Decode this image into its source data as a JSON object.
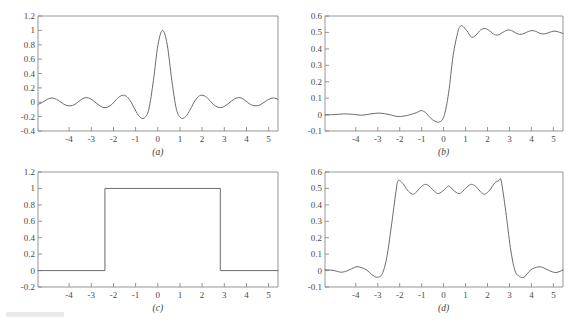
{
  "figure": {
    "background_color": "#ffffff",
    "axis_color": "#8a8a8a",
    "curve_color": "#6b6b6b",
    "label_color": "#4a4a4a",
    "layout": "2x2 grid of plots"
  },
  "chart_data": [
    {
      "id": "a",
      "type": "line",
      "caption": "(a)",
      "title": "",
      "xlabel": "",
      "ylabel": "",
      "xlim": [
        -5.4,
        5.0
      ],
      "ylim": [
        -0.4,
        1.2
      ],
      "grid": false,
      "legend": null,
      "xticks": [
        -4,
        -3,
        -2,
        -1,
        0,
        1,
        2,
        3,
        4,
        5
      ],
      "xticklabels": [
        "-4",
        "-3",
        "-2",
        "-1",
        "0",
        "1",
        "2",
        "3",
        "4",
        "5"
      ],
      "yticks": [
        -0.4,
        -0.2,
        0,
        0.2,
        0.4,
        0.6,
        0.8,
        1,
        1.2
      ],
      "yticklabels": [
        "-0.4",
        "-0.2",
        "0",
        "0.2",
        "0.4",
        "0.6",
        "0.8",
        "1",
        "1.2"
      ],
      "description": "sinc-like oscillatory kernel with main lobe peak 1 at x=0",
      "series": [
        {
          "name": "sinc kernel",
          "x": [
            -5.4,
            -5.2,
            -5.0,
            -4.8,
            -4.6,
            -4.4,
            -4.2,
            -4.0,
            -3.8,
            -3.6,
            -3.4,
            -3.2,
            -3.0,
            -2.8,
            -2.6,
            -2.4,
            -2.2,
            -2.0,
            -1.8,
            -1.6,
            -1.4,
            -1.2,
            -1.0,
            -0.8,
            -0.6,
            -0.4,
            -0.2,
            0.0,
            0.2,
            0.4,
            0.6,
            0.8,
            1.0,
            1.2,
            1.4,
            1.6,
            1.8,
            2.0,
            2.2,
            2.4,
            2.6,
            2.8,
            3.0,
            3.2,
            3.4,
            3.6,
            3.8,
            4.0,
            4.2,
            4.4,
            4.6,
            4.8,
            5.0
          ],
          "y": [
            -0.03,
            0.0,
            0.04,
            0.06,
            0.04,
            0.0,
            -0.04,
            -0.05,
            -0.03,
            0.02,
            0.06,
            0.06,
            0.02,
            -0.03,
            -0.07,
            -0.07,
            -0.03,
            0.04,
            0.09,
            0.09,
            0.02,
            -0.1,
            -0.2,
            -0.22,
            -0.1,
            0.3,
            0.8,
            1.0,
            0.8,
            0.3,
            -0.1,
            -0.22,
            -0.2,
            -0.1,
            0.02,
            0.09,
            0.09,
            0.04,
            -0.03,
            -0.07,
            -0.07,
            -0.03,
            0.02,
            0.06,
            0.06,
            0.02,
            -0.03,
            -0.05,
            -0.04,
            0.0,
            0.04,
            0.06,
            0.04
          ]
        }
      ]
    },
    {
      "id": "b",
      "type": "line",
      "caption": "(b)",
      "title": "",
      "xlabel": "",
      "ylabel": "",
      "xlim": [
        -5.4,
        5.0
      ],
      "ylim": [
        -0.1,
        0.6
      ],
      "grid": false,
      "legend": null,
      "xticks": [
        -4,
        -3,
        -2,
        -1,
        0,
        1,
        2,
        3,
        4,
        5
      ],
      "xticklabels": [
        "-4",
        "-3",
        "-2",
        "-1",
        "0",
        "1",
        "2",
        "3",
        "4",
        "5"
      ],
      "yticks": [
        -0.1,
        0,
        0.1,
        0.2,
        0.3,
        0.4,
        0.5,
        0.6
      ],
      "yticklabels": [
        "-0.1",
        "0",
        "0.1",
        "0.2",
        "0.3",
        "0.4",
        "0.5",
        "0.6"
      ],
      "description": "integrated sinc / step response with Gibbs overshoot to ~0.54 settling near 0.5",
      "series": [
        {
          "name": "step response",
          "x": [
            -5.4,
            -5.0,
            -4.6,
            -4.2,
            -3.8,
            -3.4,
            -3.0,
            -2.6,
            -2.2,
            -1.8,
            -1.4,
            -1.2,
            -1.0,
            -0.8,
            -0.6,
            -0.4,
            -0.2,
            0.0,
            0.2,
            0.4,
            0.5,
            0.6,
            0.8,
            1.0,
            1.2,
            1.4,
            1.6,
            1.8,
            2.0,
            2.2,
            2.4,
            2.6,
            2.8,
            3.0,
            3.2,
            3.4,
            3.6,
            3.8,
            4.0,
            4.2,
            4.4,
            4.6,
            4.8,
            5.0
          ],
          "y": [
            -0.003,
            0.0,
            0.004,
            0.002,
            -0.004,
            0.004,
            0.009,
            0.0,
            -0.012,
            -0.005,
            0.012,
            0.024,
            0.012,
            -0.02,
            -0.04,
            -0.045,
            -0.01,
            0.13,
            0.36,
            0.5,
            0.535,
            0.54,
            0.51,
            0.471,
            0.484,
            0.515,
            0.524,
            0.509,
            0.487,
            0.486,
            0.503,
            0.515,
            0.508,
            0.492,
            0.489,
            0.5,
            0.511,
            0.507,
            0.494,
            0.491,
            0.5,
            0.508,
            0.503,
            0.493
          ]
        }
      ]
    },
    {
      "id": "c",
      "type": "line",
      "caption": "(c)",
      "title": "",
      "xlabel": "",
      "ylabel": "",
      "xlim": [
        -5.4,
        5.0
      ],
      "ylim": [
        -0.2,
        1.2
      ],
      "grid": false,
      "legend": null,
      "xticks": [
        -4,
        -3,
        -2,
        -1,
        0,
        1,
        2,
        3,
        4,
        5
      ],
      "xticklabels": [
        "-4",
        "-3",
        "-2",
        "-1",
        "0",
        "1",
        "2",
        "3",
        "4",
        "5"
      ],
      "yticks": [
        -0.2,
        0,
        0.2,
        0.4,
        0.6,
        0.8,
        1,
        1.2
      ],
      "yticklabels": [
        "-0.2",
        "0",
        "0.2",
        "0.4",
        "0.6",
        "0.8",
        "1",
        "1.2"
      ],
      "description": "ideal rectangular pulse equal to 1 on [-2.5, 2.5] and 0 elsewhere",
      "series": [
        {
          "name": "rectangular pulse",
          "x": [
            -5.4,
            -2.5,
            -2.5,
            2.5,
            2.5,
            5.0
          ],
          "y": [
            0,
            0,
            1,
            1,
            0,
            0
          ]
        }
      ]
    },
    {
      "id": "d",
      "type": "line",
      "caption": "(d)",
      "title": "",
      "xlabel": "",
      "ylabel": "",
      "xlim": [
        -5.4,
        5.0
      ],
      "ylim": [
        -0.1,
        0.6
      ],
      "grid": false,
      "legend": null,
      "xticks": [
        -4,
        -3,
        -2,
        -1,
        0,
        1,
        2,
        3,
        4,
        5
      ],
      "xticklabels": [
        "-4",
        "-3",
        "-2",
        "-1",
        "0",
        "1",
        "2",
        "3",
        "4",
        "5"
      ],
      "yticks": [
        -0.1,
        0,
        0.1,
        0.2,
        0.3,
        0.4,
        0.5,
        0.6
      ],
      "yticklabels": [
        "-0.1",
        "0",
        "0.1",
        "0.2",
        "0.3",
        "0.4",
        "0.5",
        "0.6"
      ],
      "description": "smoothed pulse showing Gibbs ringing, plateau near 0.5 with overshoot 0.55 at edges x=-2.2 and x=2.3",
      "series": [
        {
          "name": "filtered pulse",
          "x": [
            -5.4,
            -5.0,
            -4.7,
            -4.4,
            -4.1,
            -3.9,
            -3.6,
            -3.3,
            -3.1,
            -2.9,
            -2.7,
            -2.5,
            -2.3,
            -2.2,
            -2.0,
            -1.8,
            -1.6,
            -1.45,
            -1.2,
            -1.0,
            -0.8,
            -0.6,
            -0.45,
            -0.2,
            0.0,
            0.2,
            0.45,
            0.6,
            0.8,
            1.0,
            1.2,
            1.45,
            1.6,
            1.8,
            2.0,
            2.2,
            2.3,
            2.5,
            2.7,
            2.9,
            3.1,
            3.3,
            3.6,
            3.9,
            4.1,
            4.4,
            4.7,
            5.0
          ],
          "y": [
            0.005,
            0.0,
            -0.01,
            0.0,
            0.02,
            0.022,
            0.005,
            -0.03,
            -0.04,
            -0.02,
            0.08,
            0.27,
            0.48,
            0.548,
            0.53,
            0.49,
            0.466,
            0.472,
            0.51,
            0.525,
            0.508,
            0.48,
            0.468,
            0.49,
            0.515,
            0.49,
            0.468,
            0.48,
            0.508,
            0.525,
            0.51,
            0.472,
            0.466,
            0.49,
            0.53,
            0.548,
            0.545,
            0.36,
            0.14,
            0.0,
            -0.035,
            -0.04,
            0.005,
            0.022,
            0.02,
            0.0,
            -0.012,
            0.004
          ]
        }
      ]
    }
  ]
}
